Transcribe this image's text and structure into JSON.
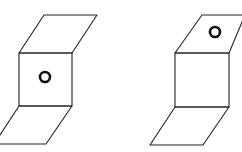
{
  "figures": [
    {
      "name": "figure-left",
      "top_panel": [
        [
          44,
          15
        ],
        [
          97,
          15
        ],
        [
          72,
          53
        ],
        [
          19,
          53
        ]
      ],
      "square_panel": [
        [
          19,
          53
        ],
        [
          72,
          53
        ],
        [
          72,
          106
        ],
        [
          19,
          106
        ]
      ],
      "bottom_panel": [
        [
          19,
          106
        ],
        [
          72,
          106
        ],
        [
          46,
          144
        ],
        [
          -6,
          144
        ]
      ],
      "circle": {
        "cx": 45,
        "cy": 77,
        "r": 5,
        "on": "square_panel"
      }
    },
    {
      "name": "figure-right",
      "top_panel": [
        [
          202,
          15
        ],
        [
          245,
          15
        ],
        [
          229,
          53
        ],
        [
          175,
          53
        ]
      ],
      "square_panel": [
        [
          175,
          53
        ],
        [
          229,
          53
        ],
        [
          229,
          107
        ],
        [
          175,
          107
        ]
      ],
      "bottom_panel": [
        [
          175,
          107
        ],
        [
          229,
          107
        ],
        [
          203,
          145
        ],
        [
          150,
          145
        ]
      ],
      "circle": {
        "cx": 215,
        "cy": 32,
        "r": 5,
        "on": "top_panel"
      }
    }
  ],
  "colors": {
    "stroke": "#222222",
    "background": "#ffffff"
  }
}
